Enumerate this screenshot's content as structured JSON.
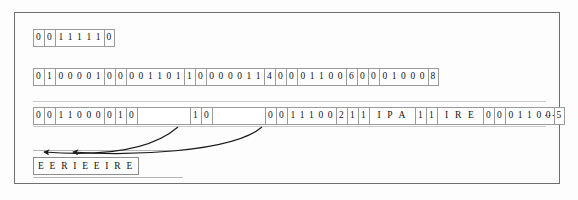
{
  "figure": {
    "frame_color": "#6e6e6e",
    "cell_border_color": "#9a9a9a",
    "text_color": "#111111",
    "ellipsis": "⋯"
  },
  "rows": [
    {
      "name": "row-1",
      "cells": [
        {
          "text": "0",
          "width": 11
        },
        {
          "text": "0",
          "width": 11
        },
        {
          "text": "1 1 1 1 1",
          "width": 49
        },
        {
          "text": "0",
          "width": 11
        }
      ]
    },
    {
      "name": "row-2",
      "cells": [
        {
          "text": "0",
          "width": 11
        },
        {
          "text": "1",
          "width": 11
        },
        {
          "text": "0 0 0 0 1",
          "width": 49
        },
        {
          "text": "0",
          "width": 11
        },
        {
          "text": "0",
          "width": 11
        },
        {
          "text": "0 0 1 1 0 1",
          "width": 58
        },
        {
          "text": "1",
          "width": 11
        },
        {
          "text": "0",
          "width": 11
        },
        {
          "text": "0 0 0 0 1 1",
          "width": 58
        },
        {
          "text": "4",
          "width": 11
        },
        {
          "text": "0",
          "width": 11
        },
        {
          "text": "0",
          "width": 11
        },
        {
          "text": "0 1 1 0 0",
          "width": 49
        },
        {
          "text": "6",
          "width": 11
        },
        {
          "text": "0",
          "width": 11
        },
        {
          "text": "0",
          "width": 11
        },
        {
          "text": "0 1 0 0 0",
          "width": 49
        },
        {
          "text": "8",
          "width": 11
        }
      ]
    },
    {
      "name": "row-3",
      "cells": [
        {
          "text": "0",
          "width": 11
        },
        {
          "text": "0",
          "width": 11
        },
        {
          "text": "1 1 0 0 0",
          "width": 49
        },
        {
          "text": "0",
          "width": 11
        },
        {
          "text": "1",
          "width": 11
        },
        {
          "text": "0",
          "width": 11
        },
        {
          "text": "",
          "width": 53,
          "blank": true
        },
        {
          "text": "1",
          "width": 11
        },
        {
          "text": "0",
          "width": 11
        },
        {
          "text": "",
          "width": 53,
          "blank": true
        },
        {
          "text": "0",
          "width": 11
        },
        {
          "text": "0",
          "width": 11
        },
        {
          "text": "1 1 1 0 0",
          "width": 49
        },
        {
          "text": "2",
          "width": 11
        },
        {
          "text": "1",
          "width": 11
        },
        {
          "text": "1",
          "width": 11
        },
        {
          "text": "I P A",
          "width": 46,
          "alpha": true
        },
        {
          "text": "1",
          "width": 11
        },
        {
          "text": "1",
          "width": 11
        },
        {
          "text": "I R E",
          "width": 46,
          "alpha": true
        },
        {
          "text": "0",
          "width": 11
        },
        {
          "text": "0",
          "width": 11
        },
        {
          "text": "0 1 1 0 0",
          "width": 49
        },
        {
          "text": "5",
          "width": 11
        }
      ]
    }
  ],
  "result": {
    "name": "decoded-string",
    "text": "E E R I E E I R E"
  },
  "arrows": [
    {
      "name": "arrow-left",
      "from_x": 178,
      "from_y": 127,
      "to_x": 44,
      "to_y": 152
    },
    {
      "name": "arrow-right",
      "from_x": 262,
      "from_y": 127,
      "to_x": 73,
      "to_y": 152
    }
  ]
}
